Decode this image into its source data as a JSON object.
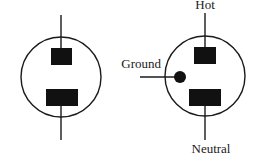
{
  "diagram": {
    "colors": {
      "stroke": "#1a1a1a",
      "fill": "#111111",
      "background": "#ffffff"
    },
    "left_outlet": {
      "type": "two-prong",
      "slots": [
        "top-slot",
        "bottom-slot"
      ]
    },
    "right_outlet": {
      "type": "three-prong",
      "labels": {
        "hot": "Hot",
        "ground": "Ground",
        "neutral": "Neutral"
      }
    }
  }
}
